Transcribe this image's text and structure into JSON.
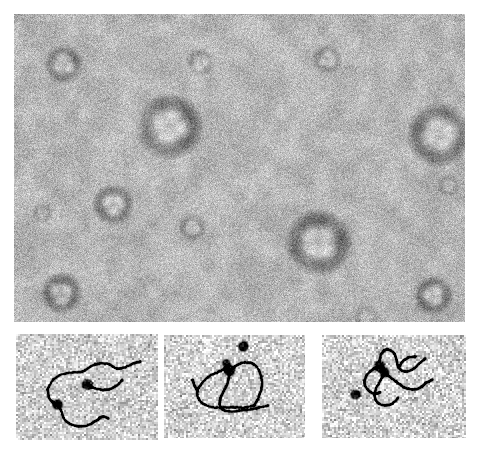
{
  "figure": {
    "kind": "electron-micrograph-figure",
    "background_color": "#ffffff",
    "width": 483,
    "height": 455,
    "panel_count": 4,
    "modality": "negative-stain transmission electron microscopy",
    "title_text": "",
    "caption_text": "",
    "scale_bar_text": ""
  },
  "panels": [
    {
      "id": "top",
      "name": "top-micrograph-panel",
      "x": 14,
      "y": 14,
      "width": 451,
      "height": 308,
      "background_mean_gray": "#b6b6b6",
      "grain_amplitude": 58,
      "grain_scale": 1,
      "vignette": 0.1,
      "content_description": "field of negatively stained ring-shaped protein particles",
      "particles": [
        {
          "cx": 155,
          "cy": 112,
          "r": 26,
          "type": "large-multilobe",
          "lobes": 4,
          "darkness": 0.92
        },
        {
          "cx": 425,
          "cy": 120,
          "r": 25,
          "type": "large-multilobe",
          "lobes": 4,
          "darkness": 0.88
        },
        {
          "cx": 304,
          "cy": 228,
          "r": 26,
          "type": "large-multilobe",
          "lobes": 4,
          "darkness": 0.9
        },
        {
          "cx": 99,
          "cy": 190,
          "r": 16,
          "type": "ring",
          "lobes": 3,
          "darkness": 0.72
        },
        {
          "cx": 47,
          "cy": 279,
          "r": 16,
          "type": "ring",
          "lobes": 3,
          "darkness": 0.7
        },
        {
          "cx": 49,
          "cy": 50,
          "r": 15,
          "type": "ring",
          "lobes": 3,
          "darkness": 0.66
        },
        {
          "cx": 419,
          "cy": 281,
          "r": 15,
          "type": "ring",
          "lobes": 3,
          "darkness": 0.68
        },
        {
          "cx": 186,
          "cy": 48,
          "r": 11,
          "type": "faint-ring",
          "lobes": 3,
          "darkness": 0.4
        },
        {
          "cx": 313,
          "cy": 45,
          "r": 12,
          "type": "faint-ring",
          "lobes": 3,
          "darkness": 0.42
        },
        {
          "cx": 178,
          "cy": 213,
          "r": 11,
          "type": "faint-ring",
          "lobes": 3,
          "darkness": 0.44
        },
        {
          "cx": 434,
          "cy": 171,
          "r": 9,
          "type": "faint-ring",
          "lobes": 3,
          "darkness": 0.34
        },
        {
          "cx": 28,
          "cy": 199,
          "r": 8,
          "type": "faint-ring",
          "lobes": 3,
          "darkness": 0.3
        },
        {
          "cx": 352,
          "cy": 303,
          "r": 10,
          "type": "faint-ring",
          "lobes": 3,
          "darkness": 0.36
        },
        {
          "cx": 447,
          "cy": 322,
          "r": 10,
          "type": "faint-ring",
          "lobes": 3,
          "darkness": 0.38
        }
      ]
    },
    {
      "id": "bottom-left",
      "name": "dna-complex-panel-1",
      "x": 16,
      "y": 334,
      "width": 142,
      "height": 106,
      "background_mean_gray": "#cfcfcf",
      "grain_amplitude": 96,
      "grain_scale": 2,
      "content_description": "relaxed circular DNA molecule with two bound dark protein complexes",
      "blobs": [
        {
          "cx": 71,
          "cy": 50,
          "r": 5.0,
          "darkness": 1.0
        },
        {
          "cx": 41,
          "cy": 70,
          "r": 4.6,
          "darkness": 1.0
        }
      ],
      "filaments": [
        [
          [
            31,
            55
          ],
          [
            36,
            46
          ],
          [
            45,
            40
          ],
          [
            56,
            38
          ],
          [
            66,
            37
          ],
          [
            74,
            32
          ],
          [
            83,
            29
          ],
          [
            93,
            30
          ],
          [
            100,
            34
          ],
          [
            108,
            33
          ],
          [
            117,
            29
          ],
          [
            124,
            27
          ]
        ],
        [
          [
            31,
            55
          ],
          [
            33,
            64
          ],
          [
            38,
            69
          ],
          [
            41,
            70
          ]
        ],
        [
          [
            41,
            70
          ],
          [
            45,
            77
          ],
          [
            48,
            85
          ],
          [
            55,
            90
          ],
          [
            64,
            92
          ],
          [
            73,
            90
          ],
          [
            80,
            86
          ],
          [
            86,
            82
          ],
          [
            92,
            84
          ]
        ],
        [
          [
            71,
            50
          ],
          [
            76,
            53
          ],
          [
            84,
            55
          ],
          [
            92,
            55
          ],
          [
            100,
            51
          ],
          [
            106,
            45
          ]
        ]
      ]
    },
    {
      "id": "bottom-middle",
      "name": "dna-complex-panel-2",
      "x": 164,
      "y": 335,
      "width": 141,
      "height": 103,
      "background_mean_gray": "#d4d4d4",
      "grain_amplitude": 104,
      "grain_scale": 2,
      "content_description": "circular DNA loop with clustered dark protein complexes at one vertex",
      "blobs": [
        {
          "cx": 65,
          "cy": 35,
          "r": 5.2,
          "darkness": 1.0
        },
        {
          "cx": 62,
          "cy": 28,
          "r": 3.4,
          "darkness": 0.9
        },
        {
          "cx": 79,
          "cy": 11,
          "r": 4.6,
          "darkness": 1.0
        }
      ],
      "filaments": [
        [
          [
            62,
            31
          ],
          [
            55,
            36
          ],
          [
            46,
            40
          ],
          [
            38,
            47
          ],
          [
            33,
            55
          ],
          [
            34,
            63
          ],
          [
            40,
            69
          ],
          [
            50,
            72
          ],
          [
            60,
            72
          ],
          [
            70,
            72
          ],
          [
            80,
            72
          ],
          [
            90,
            70
          ]
        ],
        [
          [
            65,
            35
          ],
          [
            72,
            30
          ],
          [
            80,
            27
          ],
          [
            88,
            28
          ],
          [
            94,
            34
          ],
          [
            97,
            43
          ],
          [
            97,
            53
          ],
          [
            94,
            62
          ],
          [
            90,
            70
          ]
        ],
        [
          [
            65,
            35
          ],
          [
            64,
            44
          ],
          [
            61,
            52
          ],
          [
            57,
            60
          ],
          [
            55,
            68
          ],
          [
            58,
            74
          ],
          [
            66,
            76
          ],
          [
            76,
            75
          ],
          [
            86,
            74
          ],
          [
            95,
            72
          ],
          [
            104,
            70
          ]
        ],
        [
          [
            33,
            55
          ],
          [
            30,
            50
          ],
          [
            28,
            44
          ]
        ]
      ]
    },
    {
      "id": "bottom-right",
      "name": "dna-complex-panel-3",
      "x": 322,
      "y": 335,
      "width": 144,
      "height": 103,
      "background_mean_gray": "#d2d2d2",
      "grain_amplitude": 104,
      "grain_scale": 2,
      "content_description": "branched DNA molecule with dark protein complexes and one free particle",
      "blobs": [
        {
          "cx": 57,
          "cy": 31,
          "r": 5.0,
          "darkness": 1.0
        },
        {
          "cx": 62,
          "cy": 37,
          "r": 4.2,
          "darkness": 1.0
        },
        {
          "cx": 33,
          "cy": 59,
          "r": 4.4,
          "darkness": 1.0
        }
      ],
      "filaments": [
        [
          [
            57,
            26
          ],
          [
            59,
            18
          ],
          [
            64,
            14
          ],
          [
            71,
            17
          ],
          [
            74,
            24
          ],
          [
            76,
            32
          ],
          [
            82,
            36
          ],
          [
            90,
            34
          ],
          [
            97,
            28
          ],
          [
            103,
            23
          ]
        ],
        [
          [
            62,
            37
          ],
          [
            68,
            42
          ],
          [
            75,
            47
          ],
          [
            82,
            52
          ],
          [
            90,
            54
          ],
          [
            98,
            52
          ],
          [
            104,
            47
          ],
          [
            110,
            44
          ]
        ],
        [
          [
            62,
            37
          ],
          [
            58,
            45
          ],
          [
            54,
            52
          ],
          [
            52,
            60
          ],
          [
            55,
            67
          ],
          [
            62,
            70
          ],
          [
            70,
            68
          ],
          [
            76,
            62
          ]
        ],
        [
          [
            57,
            31
          ],
          [
            50,
            34
          ],
          [
            44,
            40
          ],
          [
            42,
            48
          ],
          [
            46,
            55
          ],
          [
            52,
            58
          ],
          [
            58,
            57
          ]
        ],
        [
          [
            76,
            32
          ],
          [
            80,
            26
          ],
          [
            86,
            22
          ],
          [
            93,
            21
          ]
        ]
      ]
    }
  ],
  "icons": {
    "micrograph": "micrograph-icon"
  },
  "colors": {
    "page_background": "#ffffff",
    "panel_background": "#b9b9b9",
    "particle_dark": "#202020",
    "filament_dark": "#151515"
  }
}
